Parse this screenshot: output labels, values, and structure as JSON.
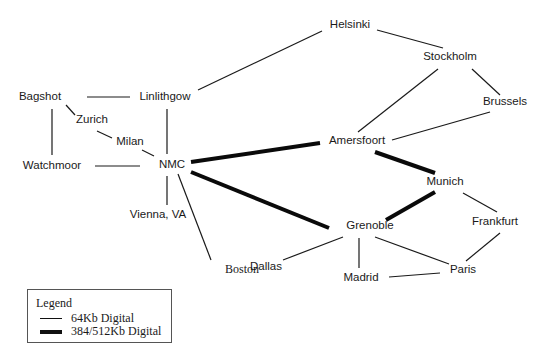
{
  "diagram": {
    "type": "network-topology",
    "nodes": [
      {
        "id": "helsinki",
        "label": "Helsinki",
        "x": 350,
        "y": 25
      },
      {
        "id": "stockholm",
        "label": "Stockholm",
        "x": 450,
        "y": 57
      },
      {
        "id": "brussels",
        "label": "Brussels",
        "x": 505,
        "y": 102
      },
      {
        "id": "amersfoort",
        "label": "Amersfoort",
        "x": 357,
        "y": 141
      },
      {
        "id": "bagshot",
        "label": "Bagshot",
        "x": 40,
        "y": 97
      },
      {
        "id": "linlithgow",
        "label": "Linlithgow",
        "x": 165,
        "y": 97
      },
      {
        "id": "zurich",
        "label": "Zurich",
        "x": 92,
        "y": 120
      },
      {
        "id": "milan",
        "label": "Milan",
        "x": 130,
        "y": 142
      },
      {
        "id": "watchmoor",
        "label": "Watchmoor",
        "x": 52,
        "y": 166
      },
      {
        "id": "nmc",
        "label": "NMC",
        "x": 172,
        "y": 165
      },
      {
        "id": "vienna",
        "label": "Vienna, VA",
        "x": 158,
        "y": 215
      },
      {
        "id": "boston",
        "label": "Boston",
        "x": 242,
        "y": 269,
        "serif": true
      },
      {
        "id": "dallas",
        "label": "Dallas",
        "x": 266,
        "y": 267
      },
      {
        "id": "grenoble",
        "label": "Grenoble",
        "x": 370,
        "y": 226
      },
      {
        "id": "madrid",
        "label": "Madrid",
        "x": 361,
        "y": 278
      },
      {
        "id": "paris",
        "label": "Paris",
        "x": 463,
        "y": 270
      },
      {
        "id": "munich",
        "label": "Munich",
        "x": 445,
        "y": 182
      },
      {
        "id": "frankfurt",
        "label": "Frankfurt",
        "x": 495,
        "y": 222
      }
    ],
    "edges": [
      {
        "from": "helsinki",
        "to": "stockholm",
        "type": "64kb",
        "x1": 377,
        "y1": 30,
        "x2": 443,
        "y2": 48
      },
      {
        "from": "helsinki",
        "to": "linlithgow",
        "type": "64kb",
        "x1": 322,
        "y1": 31,
        "x2": 198,
        "y2": 90
      },
      {
        "from": "stockholm",
        "to": "amersfoort",
        "type": "64kb",
        "x1": 438,
        "y1": 69,
        "x2": 358,
        "y2": 132
      },
      {
        "from": "stockholm",
        "to": "brussels",
        "type": "64kb",
        "x1": 472,
        "y1": 69,
        "x2": 500,
        "y2": 95
      },
      {
        "from": "brussels",
        "to": "amersfoort",
        "type": "64kb",
        "x1": 490,
        "y1": 112,
        "x2": 392,
        "y2": 140
      },
      {
        "from": "bagshot",
        "to": "linlithgow",
        "type": "64kb",
        "x1": 87,
        "y1": 97,
        "x2": 130,
        "y2": 97
      },
      {
        "from": "bagshot",
        "to": "zurich",
        "type": "64kb",
        "x1": 66,
        "y1": 105,
        "x2": 75,
        "y2": 115
      },
      {
        "from": "bagshot",
        "to": "watchmoor",
        "type": "64kb",
        "x1": 52,
        "y1": 109,
        "x2": 52,
        "y2": 155
      },
      {
        "from": "zurich",
        "to": "milan",
        "type": "64kb",
        "x1": 97,
        "y1": 131,
        "x2": 112,
        "y2": 138
      },
      {
        "from": "milan",
        "to": "nmc",
        "type": "64kb",
        "x1": 142,
        "y1": 150,
        "x2": 154,
        "y2": 156
      },
      {
        "from": "watchmoor",
        "to": "nmc",
        "type": "64kb",
        "x1": 95,
        "y1": 166,
        "x2": 140,
        "y2": 166
      },
      {
        "from": "linlithgow",
        "to": "nmc",
        "type": "64kb",
        "x1": 167,
        "y1": 109,
        "x2": 167,
        "y2": 154
      },
      {
        "from": "nmc",
        "to": "vienna",
        "type": "64kb",
        "x1": 167,
        "y1": 176,
        "x2": 167,
        "y2": 205
      },
      {
        "from": "nmc",
        "to": "boston",
        "type": "64kb",
        "x1": 178,
        "y1": 174,
        "x2": 211,
        "y2": 260
      },
      {
        "from": "nmc",
        "to": "amersfoort",
        "type": "384/512kb",
        "x1": 191,
        "y1": 162,
        "x2": 320,
        "y2": 143
      },
      {
        "from": "nmc",
        "to": "grenoble",
        "type": "384/512kb",
        "x1": 191,
        "y1": 172,
        "x2": 329,
        "y2": 228
      },
      {
        "from": "amersfoort",
        "to": "munich",
        "type": "384/512kb",
        "x1": 375,
        "y1": 152,
        "x2": 435,
        "y2": 173
      },
      {
        "from": "munich",
        "to": "grenoble",
        "type": "384/512kb",
        "x1": 435,
        "y1": 192,
        "x2": 386,
        "y2": 220
      },
      {
        "from": "munich",
        "to": "frankfurt",
        "type": "64kb",
        "x1": 463,
        "y1": 193,
        "x2": 497,
        "y2": 212
      },
      {
        "from": "frankfurt",
        "to": "paris",
        "type": "64kb",
        "x1": 500,
        "y1": 233,
        "x2": 466,
        "y2": 261
      },
      {
        "from": "grenoble",
        "to": "dallas",
        "type": "64kb",
        "x1": 343,
        "y1": 237,
        "x2": 283,
        "y2": 260
      },
      {
        "from": "grenoble",
        "to": "madrid",
        "type": "64kb",
        "x1": 359,
        "y1": 238,
        "x2": 359,
        "y2": 268
      },
      {
        "from": "grenoble",
        "to": "paris",
        "type": "64kb",
        "x1": 375,
        "y1": 237,
        "x2": 449,
        "y2": 264
      },
      {
        "from": "madrid",
        "to": "paris",
        "type": "64kb",
        "x1": 389,
        "y1": 277,
        "x2": 440,
        "y2": 273
      }
    ],
    "line_styles": {
      "64kb": {
        "width": 1.2,
        "color": "#1a1a1a"
      },
      "384/512kb": {
        "width": 4,
        "color": "#0a0a0a"
      }
    }
  },
  "legend": {
    "title": "Legend",
    "items": [
      {
        "label": "64Kb Digital",
        "style": "thin"
      },
      {
        "label": "384/512Kb Digital",
        "style": "thick"
      }
    ]
  }
}
